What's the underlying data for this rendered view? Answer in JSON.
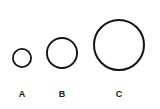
{
  "figure": {
    "background_color": "#ffffff",
    "stroke_color": "#141414",
    "fill_color": "#ffffff",
    "width": 160,
    "height": 109
  },
  "circles": [
    {
      "label": "A",
      "center_x": 22,
      "center_y": 58,
      "radius": 10,
      "diameter": 20,
      "stroke_width": 1.8,
      "label_x": 14,
      "label_y": 90
    },
    {
      "label": "B",
      "center_x": 62,
      "center_y": 53,
      "radius": 16,
      "diameter": 32,
      "stroke_width": 1.9,
      "label_x": 54,
      "label_y": 90
    },
    {
      "label": "C",
      "center_x": 119,
      "center_y": 45,
      "radius": 26,
      "diameter": 52,
      "stroke_width": 2.0,
      "label_x": 111,
      "label_y": 90
    }
  ],
  "chart_data": {
    "type": "scatter",
    "title": "",
    "xlabel": "",
    "ylabel": "",
    "categories": [
      "A",
      "B",
      "C"
    ],
    "values": [
      20,
      32,
      52
    ],
    "value_description": "circle diameter in pixels",
    "legend": [],
    "grid": false,
    "annotations": [
      "A",
      "B",
      "C"
    ]
  }
}
